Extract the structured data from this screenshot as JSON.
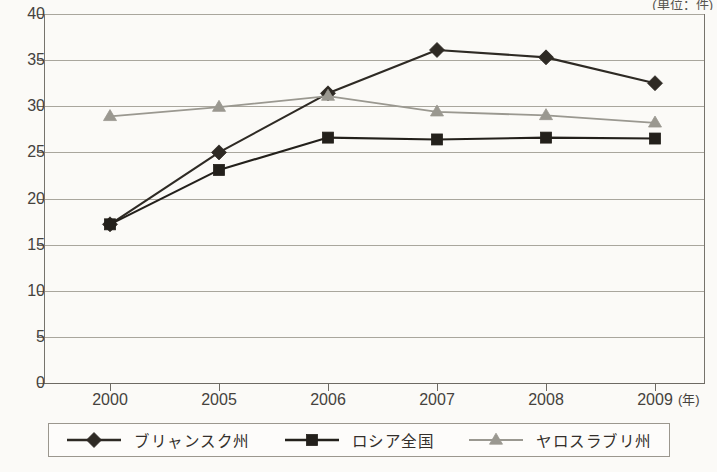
{
  "unit_caption": "(単位：件)",
  "axis": {
    "x_unit": "(年)",
    "y_ticks": [
      "0",
      "5",
      "10",
      "15",
      "20",
      "25",
      "30",
      "35",
      "40"
    ],
    "x_ticks": [
      "2000",
      "2005",
      "2006",
      "2007",
      "2008",
      "2009"
    ]
  },
  "legend": {
    "items": [
      {
        "label": "ブリャンスク州",
        "marker": "diamond-marker",
        "color": "#2e2a24"
      },
      {
        "label": "ロシア全国",
        "marker": "square-marker",
        "color": "#23201b"
      },
      {
        "label": "ヤロスラブリ州",
        "marker": "triangle-marker",
        "color": "#9a9890"
      }
    ]
  },
  "chart_data": {
    "type": "line",
    "title": "",
    "subtitle": "",
    "xlabel": "(年)",
    "ylabel": "(単位：件)",
    "categories": [
      "2000",
      "2005",
      "2006",
      "2007",
      "2008",
      "2009"
    ],
    "ylim": [
      0,
      40
    ],
    "ytick_step": 5,
    "grid": true,
    "legend_position": "bottom",
    "series": [
      {
        "name": "ブリャンスク州",
        "marker": "diamond",
        "color": "#2e2a24",
        "values": [
          17.2,
          25.0,
          31.4,
          36.1,
          35.3,
          32.5
        ]
      },
      {
        "name": "ロシア全国",
        "marker": "square",
        "color": "#23201b",
        "values": [
          17.2,
          23.1,
          26.6,
          26.4,
          26.6,
          26.5
        ]
      },
      {
        "name": "ヤロスラブリ州",
        "marker": "triangle",
        "color": "#9a9890",
        "values": [
          28.9,
          29.9,
          31.1,
          29.4,
          29.0,
          28.2
        ]
      }
    ]
  }
}
